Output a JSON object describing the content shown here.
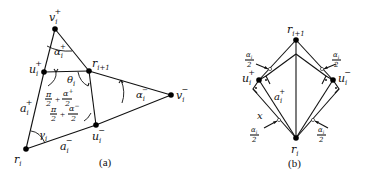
{
  "figure_a": {
    "caption": "(a)",
    "vertices": {
      "v_plus": {
        "label": "v",
        "sub": "i",
        "sup": "+"
      },
      "u_plus": {
        "label": "u",
        "sub": "i",
        "sup": "+"
      },
      "r_next": {
        "label": "r",
        "sub": "i+1"
      },
      "v_minus": {
        "label": "v",
        "sub": "i",
        "sup": "−"
      },
      "u_minus": {
        "label": "u",
        "sub": "i",
        "sup": "−"
      },
      "r_i": {
        "label": "r",
        "sub": "i"
      }
    },
    "angles": {
      "alpha_plus": {
        "label": "α",
        "sub": "i",
        "sup": "+"
      },
      "theta": {
        "label": "θ",
        "sub": "i"
      },
      "alpha_minus": {
        "label": "α",
        "sub": "i",
        "sup": "−"
      },
      "gamma": {
        "label": "γ",
        "sub": "i"
      },
      "upper_sum": {
        "pi_num": "π",
        "pi_den": "2",
        "plus": "+",
        "num": "α",
        "num_sup": "+",
        "num_sub": "i",
        "den": "2"
      },
      "lower_sum": {
        "pi_num": "π",
        "pi_den": "2",
        "plus": "+",
        "num": "α",
        "num_sup": "−",
        "num_sub": "i",
        "den": "2"
      }
    },
    "edges": {
      "a_plus": {
        "label": "a",
        "sub": "i",
        "sup": "+"
      },
      "a_minus": {
        "label": "a",
        "sub": "i",
        "sup": "−"
      }
    }
  },
  "figure_b": {
    "caption": "(b)",
    "vertices": {
      "r_next": {
        "label": "r",
        "sub": "i+1"
      },
      "u_plus": {
        "label": "u",
        "sub": "i",
        "sup": "+"
      },
      "u_minus": {
        "label": "u",
        "sub": "i",
        "sup": "−"
      },
      "r_i": {
        "label": "r",
        "sub": "i"
      }
    },
    "edges": {
      "a_plus": {
        "label": "a",
        "sub": "i",
        "sup": "+"
      },
      "x": {
        "label": "x"
      }
    },
    "angle_labels": {
      "half_alpha": {
        "num": "α",
        "num_sub": "i",
        "den": "2"
      }
    },
    "right_angle_marker": "·"
  }
}
